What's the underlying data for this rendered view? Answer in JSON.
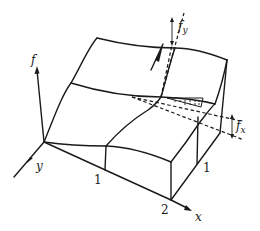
{
  "diagram": {
    "axes": {
      "f_label": "f",
      "y_label": "y",
      "x_label": "x"
    },
    "tick_labels": {
      "y_axis_front_1": "1",
      "x_axis_2": "2",
      "right_edge_1": "1"
    },
    "annotations": {
      "fy_label": "f",
      "fy_subscript": "y",
      "fx_label": "f",
      "fx_subscript": "x"
    },
    "colors": {
      "ink": "#1a1a1a",
      "background": "#ffffff"
    }
  }
}
